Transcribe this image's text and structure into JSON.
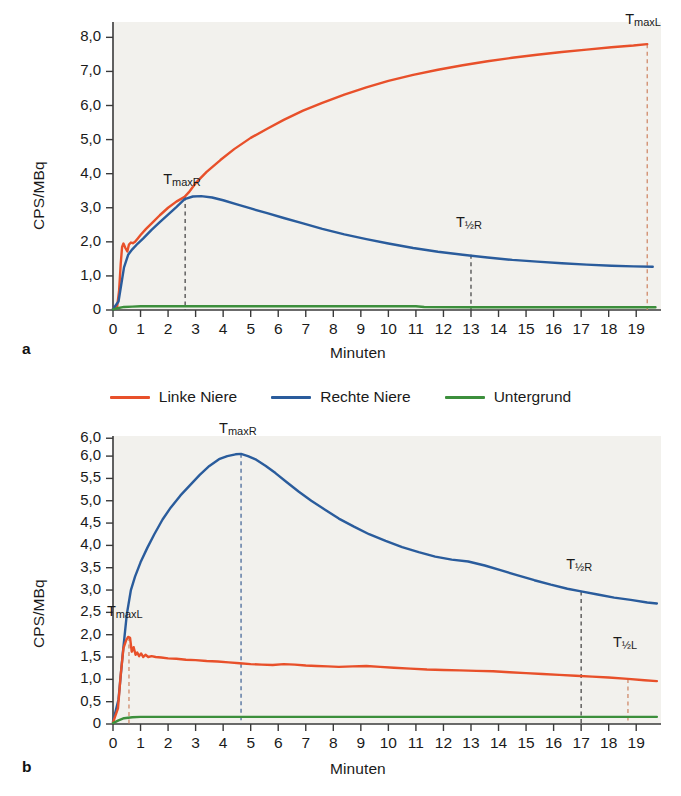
{
  "figure": {
    "legend": {
      "items": [
        {
          "label": "Linke Niere",
          "color": "#e8502a",
          "icon": "line-swatch"
        },
        {
          "label": "Rechte Niere",
          "color": "#2a5c9c",
          "icon": "line-swatch"
        },
        {
          "label": "Untergrund",
          "color": "#3c8f3c",
          "icon": "line-swatch"
        }
      ]
    },
    "panels": [
      {
        "letter": "a",
        "xlabel": "Minuten",
        "ylabel": "CPS/MBq"
      },
      {
        "letter": "b",
        "xlabel": "Minuten",
        "ylabel": "CPS/MBq"
      }
    ]
  },
  "chart_data": [
    {
      "type": "line",
      "panel": "a",
      "title": "",
      "xlabel": "Minuten",
      "ylabel": "CPS/MBq",
      "xlim": [
        0,
        19.9
      ],
      "ylim": [
        0,
        8.45
      ],
      "grid": false,
      "legend_position": "below-figure",
      "xticks": [
        0,
        1,
        2,
        3,
        4,
        5,
        6,
        7,
        8,
        9,
        10,
        11,
        12,
        13,
        14,
        15,
        16,
        17,
        18,
        19
      ],
      "xticklabels": [
        "0",
        "1",
        "2",
        "3",
        "4",
        "5",
        "6",
        "7",
        "8",
        "9",
        "10",
        "11",
        "12",
        "13",
        "14",
        "15",
        "16",
        "17",
        "18",
        "19"
      ],
      "yticks": [
        0,
        1,
        2,
        3,
        4,
        5,
        6,
        7,
        8
      ],
      "yticklabels": [
        "0",
        "1,0",
        "2,0",
        "3,0",
        "4,0",
        "5,0",
        "6,0",
        "7,0",
        "8,0"
      ],
      "series": [
        {
          "name": "Linke Niere",
          "color": "#e8502a",
          "x": [
            0.0,
            0.15,
            0.22,
            0.28,
            0.33,
            0.38,
            0.45,
            0.52,
            0.58,
            0.65,
            0.72,
            0.8,
            0.9,
            1.0,
            1.2,
            1.45,
            1.7,
            2.0,
            2.3,
            2.6,
            2.75,
            3.0,
            3.4,
            3.9,
            4.4,
            5.0,
            5.6,
            6.2,
            6.9,
            7.6,
            8.4,
            9.2,
            10.0,
            10.9,
            11.8,
            12.7,
            13.6,
            14.5,
            15.4,
            16.3,
            17.2,
            18.1,
            18.9,
            19.4
          ],
          "y": [
            0.05,
            0.1,
            0.55,
            1.35,
            1.85,
            1.95,
            1.82,
            1.72,
            1.92,
            1.98,
            1.96,
            2.0,
            2.1,
            2.2,
            2.38,
            2.58,
            2.78,
            3.0,
            3.18,
            3.32,
            3.45,
            3.72,
            4.05,
            4.4,
            4.72,
            5.05,
            5.32,
            5.58,
            5.85,
            6.08,
            6.32,
            6.53,
            6.72,
            6.9,
            7.05,
            7.18,
            7.3,
            7.4,
            7.49,
            7.57,
            7.64,
            7.71,
            7.76,
            7.8
          ]
        },
        {
          "name": "Rechte Niere",
          "color": "#2a5c9c",
          "x": [
            0.0,
            0.2,
            0.3,
            0.4,
            0.55,
            0.7,
            0.9,
            1.1,
            1.4,
            1.7,
            2.0,
            2.3,
            2.6,
            2.9,
            3.2,
            3.6,
            4.0,
            4.5,
            5.0,
            5.6,
            6.2,
            6.9,
            7.6,
            8.4,
            9.2,
            10.0,
            10.9,
            11.8,
            12.7,
            13.6,
            14.5,
            15.4,
            16.3,
            17.2,
            18.1,
            18.9,
            19.6
          ],
          "y": [
            0.03,
            0.25,
            0.75,
            1.25,
            1.62,
            1.78,
            1.95,
            2.1,
            2.35,
            2.58,
            2.8,
            3.02,
            3.25,
            3.33,
            3.34,
            3.3,
            3.22,
            3.1,
            2.98,
            2.84,
            2.7,
            2.54,
            2.38,
            2.22,
            2.08,
            1.95,
            1.82,
            1.71,
            1.62,
            1.54,
            1.47,
            1.42,
            1.37,
            1.33,
            1.3,
            1.28,
            1.27
          ]
        },
        {
          "name": "Untergrund",
          "color": "#3c8f3c",
          "x": [
            0.0,
            0.2,
            0.4,
            0.7,
            1.0,
            2.0,
            4.0,
            6.0,
            8.0,
            10.0,
            11.0,
            11.3,
            13.0,
            15.0,
            17.0,
            19.0,
            19.7
          ],
          "y": [
            0.02,
            0.06,
            0.09,
            0.1,
            0.11,
            0.11,
            0.11,
            0.11,
            0.11,
            0.11,
            0.11,
            0.09,
            0.08,
            0.08,
            0.08,
            0.08,
            0.08
          ]
        }
      ],
      "annotations": [
        {
          "label": "TmaxR",
          "text": "T",
          "sub": "maxR",
          "x": 2.62,
          "y_top": 3.55,
          "marker": "dashed-vline",
          "color": "#4a4a4a",
          "vline_from": 0,
          "vline_to": 3.33
        },
        {
          "label": "TmaxL",
          "text": "T",
          "sub": "maxL",
          "x": 19.4,
          "y_top": 8.25,
          "marker": "dashed-vline",
          "color": "#d08a6a",
          "vline_from": 0,
          "vline_to": 7.8
        },
        {
          "label": "T1/2R",
          "text": "T",
          "sub": "½R",
          "x": 13.0,
          "y_top": 2.3,
          "marker": "dashed-vline",
          "color": "#4a4a4a",
          "vline_from": 0,
          "vline_to": 1.62
        }
      ]
    },
    {
      "type": "line",
      "panel": "b",
      "title": "",
      "xlabel": "Minuten",
      "ylabel": "CPS/MBq",
      "xlim": [
        0,
        19.9
      ],
      "ylim": [
        0,
        6.45
      ],
      "grid": false,
      "legend_position": "above-panel",
      "xticks": [
        0,
        1,
        2,
        3,
        4,
        5,
        6,
        7,
        8,
        9,
        10,
        11,
        12,
        13,
        14,
        15,
        16,
        17,
        18,
        19
      ],
      "xticklabels": [
        "0",
        "1",
        "2",
        "3",
        "4",
        "5",
        "6",
        "7",
        "8",
        "9",
        "10",
        "11",
        "12",
        "13",
        "14",
        "15",
        "16",
        "17",
        "18",
        "19"
      ],
      "yticks": [
        0,
        0.5,
        1,
        1.5,
        2,
        2.5,
        3,
        3.5,
        4,
        4.5,
        5,
        5.5,
        6,
        6.4
      ],
      "yticklabels": [
        "0",
        "0,5",
        "1,0",
        "1,5",
        "2,0",
        "2,5",
        "3,0",
        "3,5",
        "4,0",
        "4,5",
        "5,0",
        "5,5",
        "6,0",
        "6,0"
      ],
      "series": [
        {
          "name": "Rechte Niere",
          "color": "#2a5c9c",
          "x": [
            0.0,
            0.2,
            0.35,
            0.5,
            0.65,
            0.8,
            1.0,
            1.25,
            1.5,
            1.8,
            2.1,
            2.45,
            2.8,
            3.15,
            3.5,
            3.85,
            4.15,
            4.45,
            4.65,
            4.9,
            5.2,
            5.55,
            5.9,
            6.3,
            6.75,
            7.2,
            7.7,
            8.2,
            8.75,
            9.3,
            9.9,
            10.5,
            11.1,
            11.7,
            12.3,
            12.9,
            13.5,
            14.1,
            14.7,
            15.3,
            15.9,
            16.5,
            17.0,
            17.6,
            18.2,
            18.8,
            19.4,
            19.75
          ],
          "y": [
            0.05,
            0.55,
            1.55,
            2.45,
            3.0,
            3.3,
            3.62,
            3.95,
            4.25,
            4.58,
            4.85,
            5.12,
            5.35,
            5.58,
            5.78,
            5.93,
            6.0,
            6.04,
            6.05,
            6.0,
            5.92,
            5.78,
            5.62,
            5.42,
            5.2,
            5.0,
            4.8,
            4.6,
            4.42,
            4.25,
            4.1,
            3.96,
            3.85,
            3.75,
            3.68,
            3.64,
            3.55,
            3.44,
            3.33,
            3.22,
            3.12,
            3.03,
            2.97,
            2.9,
            2.83,
            2.78,
            2.72,
            2.7
          ]
        },
        {
          "name": "Linke Niere",
          "color": "#e8502a",
          "x": [
            0.0,
            0.18,
            0.28,
            0.38,
            0.48,
            0.55,
            0.62,
            0.68,
            0.75,
            0.82,
            0.88,
            0.95,
            1.02,
            1.1,
            1.18,
            1.28,
            1.4,
            1.55,
            1.75,
            2.0,
            2.3,
            2.65,
            3.0,
            3.4,
            3.8,
            4.2,
            4.6,
            5.0,
            5.4,
            5.8,
            6.2,
            6.6,
            7.0,
            7.4,
            7.8,
            8.2,
            8.7,
            9.2,
            9.7,
            10.2,
            10.8,
            11.4,
            12.0,
            12.6,
            13.2,
            13.8,
            14.4,
            15.0,
            15.6,
            16.2,
            16.8,
            17.4,
            18.0,
            18.7,
            19.3,
            19.75
          ],
          "y": [
            0.03,
            0.35,
            1.1,
            1.7,
            1.88,
            1.95,
            1.93,
            1.62,
            1.72,
            1.55,
            1.6,
            1.52,
            1.58,
            1.5,
            1.55,
            1.5,
            1.52,
            1.5,
            1.49,
            1.47,
            1.46,
            1.44,
            1.43,
            1.41,
            1.4,
            1.38,
            1.36,
            1.34,
            1.33,
            1.32,
            1.34,
            1.33,
            1.31,
            1.3,
            1.29,
            1.28,
            1.29,
            1.3,
            1.28,
            1.26,
            1.24,
            1.22,
            1.21,
            1.2,
            1.19,
            1.18,
            1.16,
            1.14,
            1.12,
            1.1,
            1.08,
            1.06,
            1.04,
            1.01,
            0.98,
            0.96
          ]
        },
        {
          "name": "Untergrund",
          "color": "#3c8f3c",
          "x": [
            0.0,
            0.2,
            0.4,
            0.7,
            1.0,
            2.0,
            4.0,
            6.0,
            8.0,
            10.0,
            12.0,
            14.0,
            16.0,
            18.0,
            19.75
          ],
          "y": [
            0.02,
            0.08,
            0.13,
            0.15,
            0.16,
            0.16,
            0.16,
            0.16,
            0.16,
            0.16,
            0.16,
            0.16,
            0.16,
            0.16,
            0.16
          ]
        }
      ],
      "annotations": [
        {
          "label": "TmaxR",
          "text": "T",
          "sub": "maxR",
          "x": 4.65,
          "y_top": 6.4,
          "marker": "dashed-vline",
          "color": "#4a6a9a",
          "vline_from": 0,
          "vline_to": 6.05
        },
        {
          "label": "TmaxL",
          "text": "T",
          "sub": "maxL",
          "x": 0.58,
          "y_top": 2.3,
          "marker": "dashed-vline",
          "color": "#d08a6a",
          "vline_from": 0,
          "vline_to": 1.95
        },
        {
          "label": "T1/2R",
          "text": "T",
          "sub": "½R",
          "x": 17.0,
          "y_top": 3.35,
          "marker": "dashed-vline",
          "color": "#4a4a4a",
          "vline_from": 0,
          "vline_to": 2.97
        },
        {
          "label": "T1/2L",
          "text": "T",
          "sub": "½L",
          "x": 18.7,
          "y_top": 1.62,
          "marker": "dashed-vline",
          "color": "#d08a6a",
          "vline_from": 0,
          "vline_to": 1.01
        }
      ]
    }
  ]
}
